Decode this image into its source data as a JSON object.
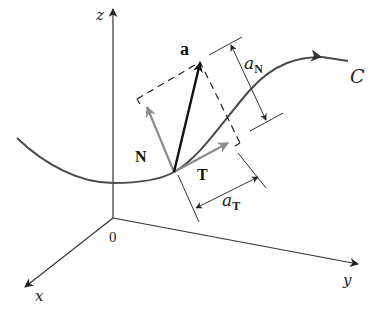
{
  "figure": {
    "axes": {
      "x_label": "x",
      "y_label": "y",
      "z_label": "z",
      "origin_label": "0"
    },
    "curve": {
      "label": "C"
    },
    "vectors": {
      "acceleration": {
        "label": "a"
      },
      "unit_normal": {
        "label": "N"
      },
      "unit_tangent": {
        "label": "T"
      }
    },
    "components": {
      "normal": {
        "base": "a",
        "subscript": "N"
      },
      "tangential": {
        "base": "a",
        "subscript": "T"
      }
    },
    "colors": {
      "axis": "#333333",
      "curve": "#4a4a4a",
      "acceleration_vector": "#111111",
      "unit_vectors": "#8c8c8c",
      "dashed_box": "#222222",
      "dimension_lines": "#333333"
    }
  }
}
